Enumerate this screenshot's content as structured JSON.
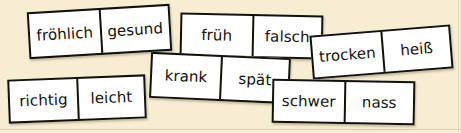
{
  "background": {
    "paper_color": "#f6edd3",
    "rule_color": "#d9cdae"
  },
  "tiles": {
    "froehlich_gesund": {
      "left_label": "fröhlich",
      "right_label": "gesund"
    },
    "frueh_falsch": {
      "left_label": "früh",
      "right_label": "falsch"
    },
    "trocken_heiss": {
      "left_label": "trocken",
      "right_label": "heiß"
    },
    "krank_spaet": {
      "left_label": "krank",
      "right_label": "spät"
    },
    "richtig_leicht": {
      "left_label": "richtig",
      "right_label": "leicht"
    },
    "schwer_nass": {
      "left_label": "schwer",
      "right_label": "nass"
    }
  }
}
